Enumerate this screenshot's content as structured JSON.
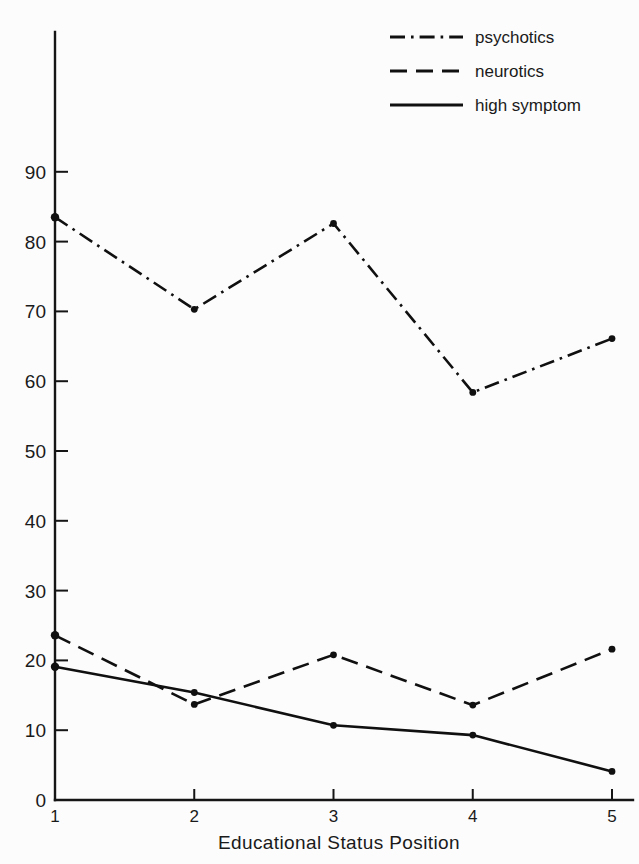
{
  "chart_data": {
    "type": "line",
    "title": "",
    "xlabel": "Educational Status Position",
    "ylabel": "",
    "x": [
      1,
      2,
      3,
      4,
      5
    ],
    "xtick_labels": [
      "1",
      "2",
      "3",
      "4",
      "5"
    ],
    "ytick_labels": [
      "0",
      "10",
      "20",
      "30",
      "40",
      "50",
      "60",
      "70",
      "80",
      "90"
    ],
    "ytick_values": [
      0,
      10,
      20,
      30,
      40,
      50,
      60,
      70,
      80,
      90
    ],
    "xlim": [
      1,
      5
    ],
    "ylim": [
      0,
      95
    ],
    "grid": false,
    "legend_position": "top-right",
    "series": [
      {
        "name": "psychotics",
        "linestyle": "dash-dot",
        "color": "#101010",
        "values": [
          83.5,
          70.3,
          82.6,
          58.4,
          66.1
        ]
      },
      {
        "name": "neurotics",
        "linestyle": "dashed",
        "color": "#101010",
        "values": [
          23.6,
          13.7,
          20.8,
          13.6,
          21.6
        ]
      },
      {
        "name": "high symptom",
        "linestyle": "solid",
        "color": "#101010",
        "values": [
          19.1,
          15.4,
          10.7,
          9.3,
          4.1
        ]
      }
    ]
  },
  "legend": {
    "entries": [
      {
        "label": "psychotics"
      },
      {
        "label": "neurotics"
      },
      {
        "label": "high symptom"
      }
    ]
  },
  "axes": {
    "x_title": "Educational Status Position"
  },
  "colors": {
    "ink": "#101010",
    "background": "#fcfcfc"
  }
}
